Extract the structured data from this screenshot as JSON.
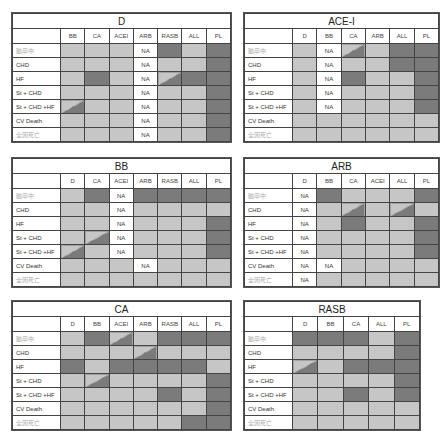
{
  "legend": {
    "light": "#c6c6c6",
    "dark": "#7b7b7b",
    "na_label": "NA"
  },
  "row_labels": [
    "脑卒中",
    "CHD",
    "HF",
    "St + CHD",
    "St + CHD +HF",
    "CV Death",
    "全因死亡"
  ],
  "panels": [
    {
      "id": "d",
      "title": "D",
      "columns": [
        "BB",
        "CA",
        "ACEI",
        "ARB",
        "RASB",
        "ALL",
        "PL"
      ],
      "rows": [
        [
          "L",
          "L",
          "L",
          "NA",
          "D",
          "L",
          "D"
        ],
        [
          "L",
          "L",
          "L",
          "NA",
          "L",
          "L",
          "D"
        ],
        [
          "L",
          "D",
          "L",
          "NA",
          "X",
          "D",
          "D"
        ],
        [
          "L",
          "L",
          "L",
          "NA",
          "L",
          "L",
          "D"
        ],
        [
          "X",
          "L",
          "L",
          "NA",
          "L",
          "L",
          "D"
        ],
        [
          "L",
          "L",
          "L",
          "NA",
          "L",
          "L",
          "D"
        ],
        [
          "L",
          "L",
          "L",
          "NA",
          "L",
          "L",
          "D"
        ]
      ]
    },
    {
      "id": "ace-i",
      "title": "ACE-I",
      "columns": [
        "D",
        "BB",
        "CA",
        "ARB",
        "ALL",
        "PL"
      ],
      "rows": [
        [
          "L",
          "NA",
          "X",
          "L",
          "D",
          "D"
        ],
        [
          "L",
          "NA",
          "L",
          "L",
          "D",
          "D"
        ],
        [
          "L",
          "NA",
          "D",
          "L",
          "L",
          "D"
        ],
        [
          "L",
          "NA",
          "L",
          "L",
          "L",
          "D"
        ],
        [
          "L",
          "NA",
          "L",
          "L",
          "L",
          "D"
        ],
        [
          "L",
          "L",
          "L",
          "L",
          "L",
          "L"
        ],
        [
          "L",
          "L",
          "L",
          "L",
          "L",
          "L"
        ]
      ]
    },
    {
      "id": "bb",
      "title": "BB",
      "columns": [
        "D",
        "CA",
        "ACEI",
        "ARB",
        "RASB",
        "ALL",
        "PL"
      ],
      "rows": [
        [
          "L",
          "D",
          "NA",
          "D",
          "D",
          "D",
          "D"
        ],
        [
          "L",
          "L",
          "NA",
          "L",
          "L",
          "L",
          "L"
        ],
        [
          "L",
          "L",
          "NA",
          "L",
          "L",
          "L",
          "D"
        ],
        [
          "L",
          "X",
          "NA",
          "L",
          "L",
          "L",
          "D"
        ],
        [
          "X",
          "L",
          "NA",
          "L",
          "L",
          "L",
          "D"
        ],
        [
          "L",
          "L",
          "L",
          "NA",
          "L",
          "L",
          "L"
        ],
        [
          "L",
          "L",
          "L",
          "L",
          "L",
          "L",
          "L"
        ]
      ]
    },
    {
      "id": "arb",
      "title": "ARB",
      "columns": [
        "D",
        "BB",
        "CA",
        "ACEI",
        "ALL",
        "PL"
      ],
      "rows": [
        [
          "NA",
          "D",
          "L",
          "L",
          "L",
          "D"
        ],
        [
          "NA",
          "L",
          "X",
          "L",
          "X",
          "L"
        ],
        [
          "NA",
          "L",
          "D",
          "L",
          "L",
          "D"
        ],
        [
          "NA",
          "L",
          "L",
          "L",
          "L",
          "D"
        ],
        [
          "NA",
          "L",
          "L",
          "L",
          "L",
          "D"
        ],
        [
          "NA",
          "NA",
          "L",
          "L",
          "L",
          "L"
        ],
        [
          "NA",
          "L",
          "L",
          "L",
          "L",
          "L"
        ]
      ]
    },
    {
      "id": "ca",
      "title": "CA",
      "columns": [
        "D",
        "BB",
        "ACEI",
        "ARB",
        "RASB",
        "ALL",
        "PL"
      ],
      "rows": [
        [
          "L",
          "D",
          "X",
          "L",
          "D",
          "D",
          "D"
        ],
        [
          "L",
          "L",
          "L",
          "X",
          "L",
          "L",
          "L"
        ],
        [
          "D",
          "L",
          "D",
          "D",
          "D",
          "D",
          "L"
        ],
        [
          "L",
          "X",
          "L",
          "L",
          "L",
          "L",
          "D"
        ],
        [
          "L",
          "L",
          "L",
          "L",
          "D",
          "L",
          "D"
        ],
        [
          "L",
          "L",
          "L",
          "L",
          "L",
          "L",
          "D"
        ],
        [
          "L",
          "L",
          "L",
          "L",
          "L",
          "D",
          "D"
        ]
      ]
    },
    {
      "id": "rasb",
      "title": "RASB",
      "columns": [
        "D",
        "BB",
        "CA",
        "ALL",
        "PL"
      ],
      "rows": [
        [
          "D",
          "D",
          "D",
          "L",
          "D"
        ],
        [
          "L",
          "L",
          "L",
          "L",
          "D"
        ],
        [
          "X",
          "L",
          "D",
          "D",
          "D"
        ],
        [
          "L",
          "L",
          "L",
          "L",
          "D"
        ],
        [
          "L",
          "L",
          "D",
          "L",
          "D"
        ],
        [
          "L",
          "L",
          "L",
          "L",
          "L"
        ],
        [
          "L",
          "L",
          "L",
          "L",
          "L"
        ]
      ]
    }
  ]
}
